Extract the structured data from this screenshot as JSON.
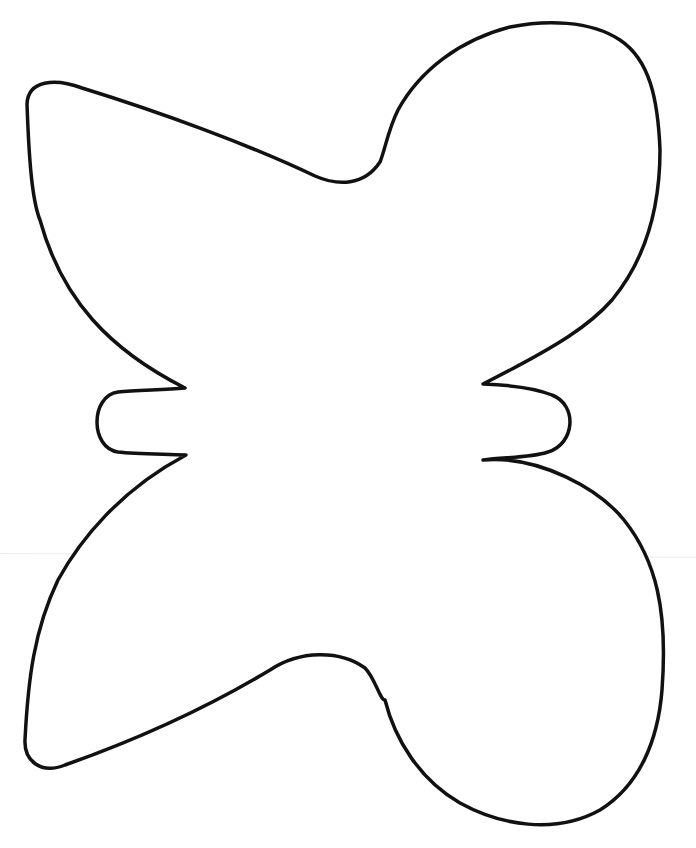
{
  "page": {
    "background": "#ffffff"
  },
  "figure": {
    "shape": "butterfly-outline",
    "stroke_color": "#111111",
    "stroke_width": 3.5,
    "fill_color": "#ffffff",
    "parts": [
      {
        "name": "upper-left-wing"
      },
      {
        "name": "upper-right-wing"
      },
      {
        "name": "lower-left-wing"
      },
      {
        "name": "lower-right-wing"
      },
      {
        "name": "left-body-tab"
      },
      {
        "name": "right-body-tab"
      }
    ]
  },
  "artifacts": {
    "fold_line_color": "#ececec"
  }
}
